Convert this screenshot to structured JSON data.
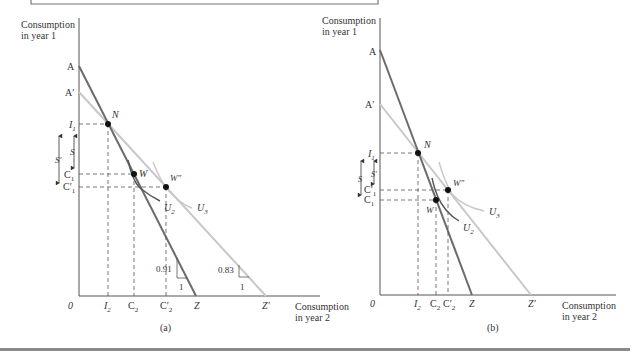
{
  "figure": {
    "panels": [
      {
        "id": "a",
        "caption": "(a)",
        "y_axis_label": [
          "Consumption",
          "in year 1"
        ],
        "x_axis_label": [
          "Consumption",
          "in year 2"
        ],
        "origin": "0",
        "y_labels": {
          "A": "A",
          "A_prime": "A′",
          "I1": "I",
          "I1_sub": "1",
          "S": "S",
          "S_prime": "S′",
          "C1": "C",
          "C1_sub": "1",
          "C1p": "C′",
          "C1p_sub": "1"
        },
        "x_labels": {
          "I2": "I",
          "I2_sub": "2",
          "C2": "C",
          "C2_sub": "2",
          "C2p": "C′",
          "C2p_sub": "2",
          "Z": "Z",
          "Z_prime": "Z′"
        },
        "points": {
          "N": "N",
          "W": "W",
          "W_pp": "W″"
        },
        "curves": {
          "U2": "U",
          "U2_sub": "2",
          "U3": "U",
          "U3_sub": "3"
        },
        "slopes": [
          {
            "rise": "0.91",
            "run": "1"
          },
          {
            "rise": "0.83",
            "run": "1"
          }
        ]
      },
      {
        "id": "b",
        "caption": "(b)",
        "y_axis_label": [
          "Consumption",
          "in year 1"
        ],
        "x_axis_label": [
          "Consumption",
          "in year 2"
        ],
        "origin": "0",
        "y_labels": {
          "A": "A",
          "A_prime": "A′",
          "I1": "I",
          "I1_sub": "1",
          "S": "S",
          "S_prime": "S′",
          "C1": "C",
          "C1_sub": "1",
          "C1p": "C′",
          "C1p_sub": "1"
        },
        "x_labels": {
          "I2": "I",
          "I2_sub": "2",
          "C2": "C",
          "C2_sub": "2",
          "C2p": "C′",
          "C2p_sub": "2",
          "Z": "Z",
          "Z_prime": "Z′"
        },
        "points": {
          "N": "N",
          "W": "W",
          "W_pp": "W″"
        },
        "curves": {
          "U2": "U",
          "U2_sub": "2",
          "U3": "U",
          "U3_sub": "3"
        }
      }
    ],
    "colors": {
      "budget_line_pre": "#6b6b6b",
      "budget_line_post": "#c8c8c8",
      "axis": "#555555",
      "point": "#111111",
      "bottom_rule": "#8a8a8a"
    }
  }
}
